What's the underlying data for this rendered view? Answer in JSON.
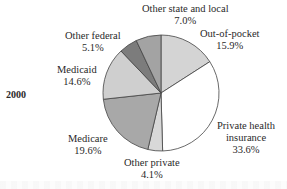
{
  "chart_data": {
    "type": "pie",
    "title": "",
    "year_label": "2000",
    "start_angle_deg": 0,
    "direction": "clockwise",
    "slices": [
      {
        "label": "Out-of-pocket",
        "value": 15.9,
        "display": "15.9%",
        "color": "#d4d4d4"
      },
      {
        "label": "Private health insurance",
        "value": 33.6,
        "display": "33.6%",
        "color": "#ffffff"
      },
      {
        "label": "Other private",
        "value": 4.1,
        "display": "4.1%",
        "color": "#d8d8d8"
      },
      {
        "label": "Medicare",
        "value": 19.6,
        "display": "19.6%",
        "color": "#a8a8a8"
      },
      {
        "label": "Medicaid",
        "value": 14.6,
        "display": "14.6%",
        "color": "#cfcfcf"
      },
      {
        "label": "Other federal",
        "value": 5.1,
        "display": "5.1%",
        "color": "#7c7c7c"
      },
      {
        "label": "Other state and local",
        "value": 7.0,
        "display": "7.0%",
        "color": "#a3a3a3"
      }
    ]
  },
  "labels": {
    "year": "2000",
    "out_of_pocket": {
      "name": "Out-of-pocket",
      "pct": "15.9%"
    },
    "private_health": {
      "name1": "Private health",
      "name2": "insurance",
      "pct": "33.6%"
    },
    "other_private": {
      "name": "Other private",
      "pct": "4.1%"
    },
    "medicare": {
      "name": "Medicare",
      "pct": "19.6%"
    },
    "medicaid": {
      "name": "Medicaid",
      "pct": "14.6%"
    },
    "other_federal": {
      "name": "Other federal",
      "pct": "5.1%"
    },
    "other_state": {
      "name": "Other state and local",
      "pct": "7.0%"
    }
  },
  "pie": {
    "cx": 161,
    "cy": 93,
    "r": 58,
    "stroke": "#444444"
  }
}
